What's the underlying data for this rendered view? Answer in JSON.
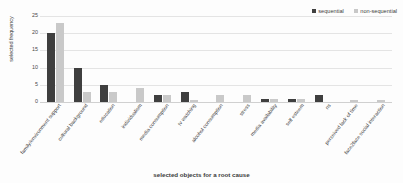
{
  "chart_data": {
    "type": "bar",
    "title": "",
    "xlabel": "selected objects for a root cause",
    "ylabel": "selected frequency",
    "ylim": [
      0,
      25
    ],
    "yticks": [
      0,
      5,
      10,
      15,
      20,
      25
    ],
    "grid": true,
    "legend_position": "top-right",
    "categories": [
      "family/environment support",
      "cultural background",
      "education",
      "individualism",
      "media consumption",
      "tv watching",
      "alcohol consumption",
      "stress",
      "media availability",
      "self esteem",
      "ns",
      "perceived lack of time",
      "face2face social interaction"
    ],
    "series": [
      {
        "name": "sequential",
        "color": "#3f3f3f",
        "values": [
          20,
          10,
          5,
          0,
          2,
          3,
          0,
          0,
          1,
          1,
          2,
          0,
          0
        ]
      },
      {
        "name": "non-sequential",
        "color": "#c9c9c9",
        "values": [
          23,
          3,
          3,
          4,
          2,
          0.5,
          2,
          2,
          1,
          1,
          0,
          0.5,
          0.5
        ]
      }
    ]
  },
  "legend": {
    "entries": [
      {
        "label": "sequential"
      },
      {
        "label": "non-sequential"
      }
    ]
  }
}
